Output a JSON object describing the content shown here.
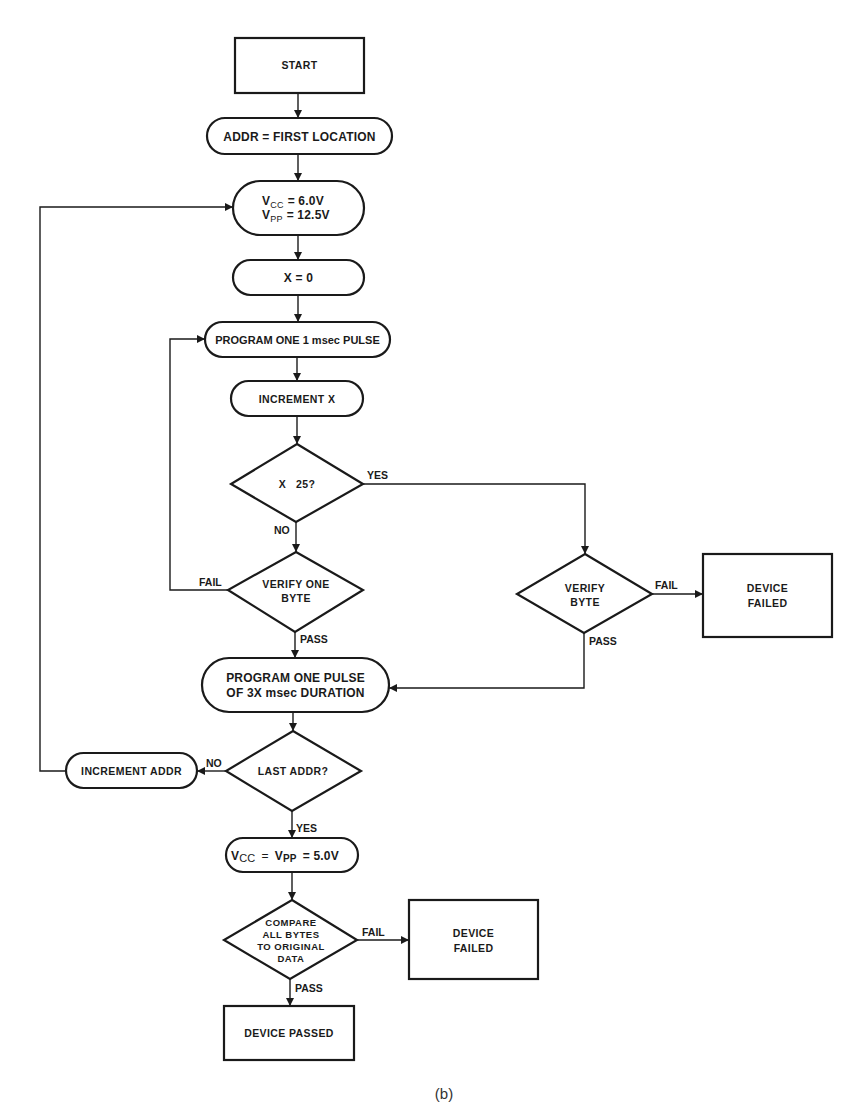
{
  "figure": {
    "caption": "(b)",
    "colors": {
      "ink": "#1a1a1a",
      "background": "#ffffff"
    }
  },
  "nodes": {
    "start": {
      "label": "START",
      "shape": "rectangle"
    },
    "addr_first": {
      "label": "ADDR = FIRST LOCATION",
      "shape": "rounded"
    },
    "set_voltage": {
      "line1": {
        "var": "V",
        "sub": "CC",
        "value": "= 6.0V"
      },
      "line2": {
        "var": "V",
        "sub": "PP",
        "value": "= 12.5V"
      },
      "shape": "rounded"
    },
    "x_zero": {
      "label": "X = 0",
      "shape": "rounded"
    },
    "program_1ms": {
      "label": "PROGRAM ONE 1 msec PULSE",
      "shape": "rounded"
    },
    "increment_x": {
      "label": "INCREMENT X",
      "shape": "rounded"
    },
    "x_check": {
      "label": "X   25?",
      "shape": "diamond"
    },
    "verify_one_byte": {
      "line1": "VERIFY ONE",
      "line2": "BYTE",
      "shape": "diamond"
    },
    "verify_byte": {
      "line1": "VERIFY",
      "line2": "BYTE",
      "shape": "diamond"
    },
    "device_failed_1": {
      "line1": "DEVICE",
      "line2": "FAILED",
      "shape": "rectangle"
    },
    "program_3x": {
      "line1": "PROGRAM ONE PULSE",
      "line2": "OF 3X msec DURATION",
      "shape": "rounded"
    },
    "last_addr": {
      "label": "LAST ADDR?",
      "shape": "diamond"
    },
    "increment_addr": {
      "label": "INCREMENT ADDR",
      "shape": "rounded"
    },
    "final_voltage": {
      "vcc": {
        "var": "V",
        "sub": "CC"
      },
      "eq1": "=",
      "vpp": {
        "var": "V",
        "sub": "PP"
      },
      "eq2": "= 5.0V",
      "shape": "rounded"
    },
    "compare": {
      "lines": [
        "COMPARE",
        "ALL BYTES",
        "TO ORIGINAL",
        "DATA"
      ],
      "shape": "diamond"
    },
    "device_failed_2": {
      "line1": "DEVICE",
      "line2": "FAILED",
      "shape": "rectangle"
    },
    "device_passed": {
      "label": "DEVICE PASSED",
      "shape": "rectangle"
    }
  },
  "edge_labels": {
    "x_check_yes": "YES",
    "x_check_no": "NO",
    "verify_one_fail": "FAIL",
    "verify_one_pass": "PASS",
    "verify_byte_fail": "FAIL",
    "verify_byte_pass": "PASS",
    "last_addr_no": "NO",
    "last_addr_yes": "YES",
    "compare_fail": "FAIL",
    "compare_pass": "PASS"
  }
}
